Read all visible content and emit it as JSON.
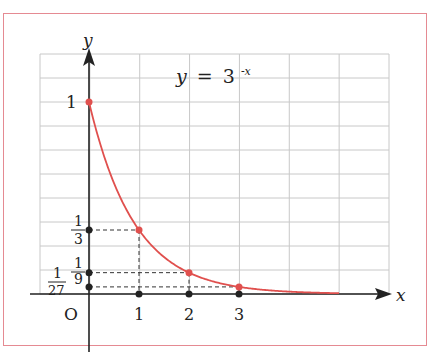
{
  "chart_data": {
    "type": "line",
    "equation": {
      "lhs": "y",
      "eq": "=",
      "base": "3",
      "exponent": "-x"
    },
    "xlabel": "x",
    "ylabel": "y",
    "origin_label": "O",
    "x_ticks": [
      "1",
      "2",
      "3"
    ],
    "y_ticks": [
      {
        "label": "1",
        "value": 1
      },
      {
        "num": "1",
        "den": "3",
        "value": 0.3333
      },
      {
        "num": "1",
        "den": "9",
        "value": 0.1111
      },
      {
        "num": "1",
        "den": "27",
        "value": 0.037
      }
    ],
    "x": [
      0,
      1,
      2,
      3
    ],
    "values": [
      1,
      0.3333,
      0.1111,
      0.037
    ],
    "highlighted_points": [
      [
        0,
        1
      ],
      [
        1,
        0.3333
      ],
      [
        2,
        0.1111
      ],
      [
        3,
        0.037
      ]
    ],
    "curve_domain": [
      0,
      5
    ],
    "xlim": [
      -1,
      6
    ],
    "ylim": [
      0,
      1.25
    ],
    "grid": true,
    "grid_step": {
      "x": 1,
      "y": 0.125
    },
    "colors": {
      "curve": "#e0504e",
      "frame": "#e58a92",
      "grid": "#c8c8c8",
      "axis": "#222222"
    }
  }
}
